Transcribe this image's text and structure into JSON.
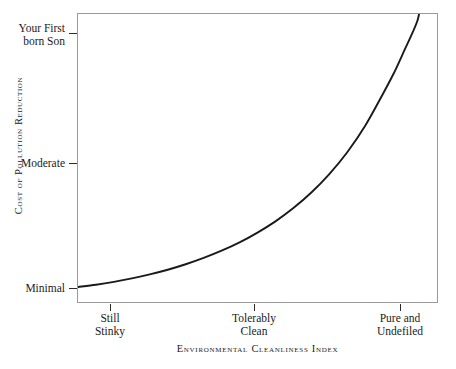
{
  "chart_data": {
    "type": "line",
    "title": "",
    "xlabel": "Environmental Cleanliness Index",
    "ylabel": "Cost of Pollution Reduction",
    "grid": false,
    "legend": "none",
    "annotation": "Exponentially rising cost curve: cost of pollution reduction grows without bound as environmental cleanliness approaches purity.",
    "x_tick_labels": [
      "Still\nStinky",
      "Tolerably\nClean",
      "Pure and\nUndefiled"
    ],
    "x_tick_positions": [
      0.09,
      0.49,
      0.895
    ],
    "y_tick_labels": [
      "Your First\nborn Son",
      "Moderate",
      "Minimal"
    ],
    "y_tick_positions": [
      0.931,
      0.483,
      0.052
    ],
    "xlim": [
      0,
      1
    ],
    "ylim": [
      0,
      1
    ],
    "series": [
      {
        "name": "Cost of pollution reduction",
        "x": [
          0.0,
          0.05,
          0.1,
          0.15,
          0.2,
          0.25,
          0.3,
          0.35,
          0.4,
          0.45,
          0.5,
          0.55,
          0.6,
          0.65,
          0.7,
          0.75,
          0.8,
          0.85,
          0.88,
          0.91,
          0.93,
          0.945,
          0.95
        ],
        "y": [
          0.052,
          0.06,
          0.07,
          0.082,
          0.096,
          0.112,
          0.131,
          0.153,
          0.178,
          0.207,
          0.241,
          0.28,
          0.326,
          0.38,
          0.444,
          0.52,
          0.612,
          0.724,
          0.795,
          0.876,
          0.93,
          0.975,
          1.0
        ]
      }
    ]
  },
  "axes": {
    "y_title": "Cost of Pollution Reduction",
    "x_title": "Environmental Cleanliness Index",
    "y_ticks": [
      {
        "label": "Your First\nborn Son"
      },
      {
        "label": "Moderate"
      },
      {
        "label": "Minimal"
      }
    ],
    "x_ticks": [
      {
        "label": "Still\nStinky"
      },
      {
        "label": "Tolerably\nClean"
      },
      {
        "label": "Pure and\nUndefiled"
      }
    ]
  },
  "style": {
    "curve_color": "#1a1a1a",
    "frame_color": "#9a9a9a",
    "text_color": "#1b1b1b",
    "background": "#ffffff"
  }
}
